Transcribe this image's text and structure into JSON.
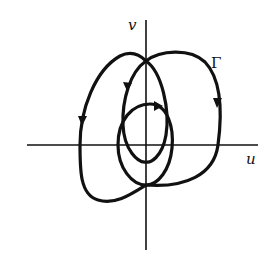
{
  "diagram": {
    "type": "phase-plane trajectory",
    "axes": {
      "horizontal_label": "u",
      "vertical_label": "v"
    },
    "curve_label": "Γ",
    "colors": {
      "stroke": "#111111",
      "background": "#ffffff"
    },
    "curves": [
      {
        "name": "outer-loop",
        "direction": "counterclockwise"
      },
      {
        "name": "inner-teardrop",
        "direction": "counterclockwise"
      },
      {
        "name": "small-loop",
        "direction": "clockwise"
      }
    ]
  }
}
